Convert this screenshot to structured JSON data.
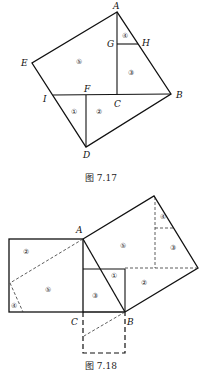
{
  "figures": [
    {
      "caption": "图 7.17",
      "points": {
        "A": "A",
        "B": "B",
        "C": "C",
        "D": "D",
        "E": "E",
        "F": "F",
        "G": "G",
        "H": "H",
        "I": "I"
      },
      "regions": {
        "r1": "①",
        "r2": "②",
        "r3": "③",
        "r4": "④",
        "r5": "⑤"
      }
    },
    {
      "caption": "图 7.18",
      "points": {
        "A": "A",
        "B": "B",
        "C": "C"
      },
      "regions": {
        "left_r2": "②",
        "left_r5": "⑤",
        "left_r4": "④",
        "mid_r3": "③",
        "mid_r1": "①",
        "right_r5": "⑤",
        "right_r3": "③",
        "right_r4": "④",
        "right_r2": "②"
      }
    }
  ]
}
